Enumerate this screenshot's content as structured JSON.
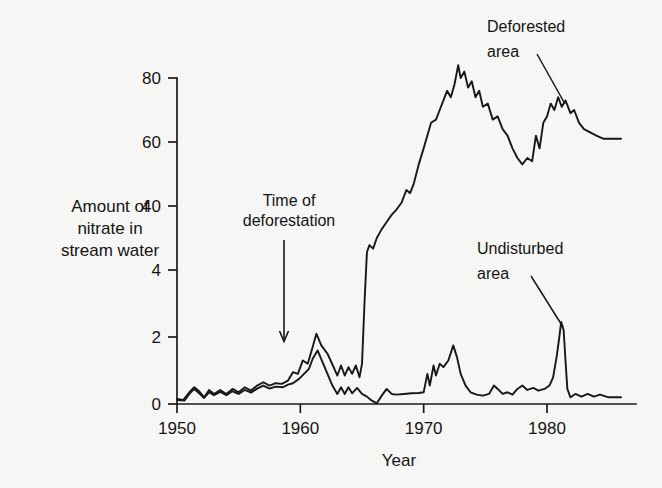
{
  "chart_data": {
    "type": "line",
    "title": "",
    "xlabel": "Year",
    "ylabel": "Amount of nitrate in stream water",
    "ylabel_lines": [
      "Amount of",
      "nitrate in",
      "stream water"
    ],
    "xlim": [
      1950,
      1986
    ],
    "xticks": [
      1950,
      1960,
      1970,
      1980
    ],
    "xtick_labels": [
      "1950",
      "1960",
      "1970",
      "1980"
    ],
    "yticks": [
      0,
      2,
      4,
      40,
      60,
      80
    ],
    "ytick_labels": [
      "0",
      "2",
      "4",
      "40",
      "60",
      "80"
    ],
    "y_axis_note": "broken / split scale: 0-4 expanded at bottom, 40-80 above",
    "grid": false,
    "legend": "annotations",
    "annotations": [
      {
        "text_lines": [
          "Time of",
          "deforestation"
        ],
        "text": "Time of deforestation",
        "points_to_year": 1958.5,
        "marker": "down-arrow"
      },
      {
        "text_lines": [
          "Deforested",
          "area"
        ],
        "text": "Deforested area",
        "points_to_year": 1977.5,
        "marker": "leader-line"
      },
      {
        "text_lines": [
          "Undisturbed",
          "area"
        ],
        "text": "Undisturbed area",
        "points_to_year": 1981.0,
        "marker": "leader-line"
      }
    ],
    "series": [
      {
        "name": "Deforested area",
        "points": [
          [
            1950.0,
            0.15
          ],
          [
            1950.5,
            0.12
          ],
          [
            1951.0,
            0.35
          ],
          [
            1951.4,
            0.5
          ],
          [
            1951.8,
            0.38
          ],
          [
            1952.2,
            0.2
          ],
          [
            1952.6,
            0.42
          ],
          [
            1953.0,
            0.3
          ],
          [
            1953.5,
            0.42
          ],
          [
            1954.0,
            0.3
          ],
          [
            1954.5,
            0.45
          ],
          [
            1955.0,
            0.35
          ],
          [
            1955.5,
            0.5
          ],
          [
            1956.0,
            0.4
          ],
          [
            1956.5,
            0.55
          ],
          [
            1957.0,
            0.65
          ],
          [
            1957.5,
            0.55
          ],
          [
            1958.0,
            0.62
          ],
          [
            1958.5,
            0.6
          ],
          [
            1959.0,
            0.7
          ],
          [
            1959.4,
            0.95
          ],
          [
            1959.8,
            0.9
          ],
          [
            1960.2,
            1.3
          ],
          [
            1960.6,
            1.2
          ],
          [
            1961.0,
            1.7
          ],
          [
            1961.3,
            2.1
          ],
          [
            1961.7,
            1.75
          ],
          [
            1962.2,
            1.5
          ],
          [
            1962.7,
            1.1
          ],
          [
            1963.0,
            0.85
          ],
          [
            1963.3,
            1.15
          ],
          [
            1963.6,
            0.85
          ],
          [
            1963.9,
            1.1
          ],
          [
            1964.2,
            0.9
          ],
          [
            1964.5,
            1.15
          ],
          [
            1964.8,
            0.8
          ],
          [
            1965.0,
            1.2
          ],
          [
            1965.2,
            3.0
          ],
          [
            1965.4,
            14
          ],
          [
            1965.6,
            18
          ],
          [
            1965.9,
            16
          ],
          [
            1966.2,
            22
          ],
          [
            1966.6,
            27
          ],
          [
            1967.0,
            31
          ],
          [
            1967.4,
            35
          ],
          [
            1967.8,
            38
          ],
          [
            1968.2,
            41
          ],
          [
            1968.6,
            45
          ],
          [
            1968.9,
            44
          ],
          [
            1969.2,
            47
          ],
          [
            1969.6,
            53
          ],
          [
            1970.0,
            58
          ],
          [
            1970.3,
            62
          ],
          [
            1970.6,
            66
          ],
          [
            1971.0,
            67
          ],
          [
            1971.3,
            70
          ],
          [
            1971.6,
            73
          ],
          [
            1971.9,
            76
          ],
          [
            1972.2,
            74
          ],
          [
            1972.5,
            78
          ],
          [
            1972.8,
            84
          ],
          [
            1973.0,
            80
          ],
          [
            1973.3,
            82
          ],
          [
            1973.6,
            77
          ],
          [
            1973.9,
            79
          ],
          [
            1974.2,
            74
          ],
          [
            1974.5,
            76
          ],
          [
            1974.8,
            71
          ],
          [
            1975.2,
            72
          ],
          [
            1975.6,
            67
          ],
          [
            1976.0,
            68
          ],
          [
            1976.4,
            64
          ],
          [
            1976.8,
            62
          ],
          [
            1977.2,
            58
          ],
          [
            1977.6,
            55
          ],
          [
            1978.0,
            53
          ],
          [
            1978.4,
            55
          ],
          [
            1978.8,
            54
          ],
          [
            1979.1,
            62
          ],
          [
            1979.4,
            58
          ],
          [
            1979.7,
            66
          ],
          [
            1980.0,
            68
          ],
          [
            1980.3,
            72
          ],
          [
            1980.6,
            70
          ],
          [
            1980.9,
            74
          ],
          [
            1981.2,
            71
          ],
          [
            1981.5,
            73
          ],
          [
            1981.9,
            69
          ],
          [
            1982.2,
            70
          ],
          [
            1982.6,
            66
          ],
          [
            1983.0,
            64
          ],
          [
            1983.5,
            63
          ],
          [
            1984.0,
            62
          ],
          [
            1984.6,
            61
          ],
          [
            1985.3,
            61
          ],
          [
            1986.0,
            61
          ]
        ]
      },
      {
        "name": "Undisturbed area",
        "points": [
          [
            1950.0,
            0.12
          ],
          [
            1950.6,
            0.1
          ],
          [
            1951.0,
            0.3
          ],
          [
            1951.4,
            0.45
          ],
          [
            1951.8,
            0.32
          ],
          [
            1952.2,
            0.18
          ],
          [
            1952.6,
            0.35
          ],
          [
            1953.0,
            0.26
          ],
          [
            1953.5,
            0.36
          ],
          [
            1954.0,
            0.26
          ],
          [
            1954.5,
            0.38
          ],
          [
            1955.0,
            0.3
          ],
          [
            1955.5,
            0.42
          ],
          [
            1956.0,
            0.34
          ],
          [
            1956.5,
            0.46
          ],
          [
            1957.0,
            0.55
          ],
          [
            1957.5,
            0.46
          ],
          [
            1958.0,
            0.52
          ],
          [
            1958.6,
            0.5
          ],
          [
            1959.0,
            0.58
          ],
          [
            1959.4,
            0.62
          ],
          [
            1959.9,
            0.75
          ],
          [
            1960.3,
            0.9
          ],
          [
            1960.7,
            1.05
          ],
          [
            1961.0,
            1.35
          ],
          [
            1961.4,
            1.6
          ],
          [
            1961.8,
            1.25
          ],
          [
            1962.2,
            0.9
          ],
          [
            1962.6,
            0.55
          ],
          [
            1963.0,
            0.3
          ],
          [
            1963.3,
            0.5
          ],
          [
            1963.6,
            0.3
          ],
          [
            1963.9,
            0.5
          ],
          [
            1964.2,
            0.32
          ],
          [
            1964.6,
            0.48
          ],
          [
            1965.0,
            0.3
          ],
          [
            1965.4,
            0.22
          ],
          [
            1965.8,
            0.1
          ],
          [
            1966.2,
            0.02
          ],
          [
            1966.6,
            0.25
          ],
          [
            1967.0,
            0.45
          ],
          [
            1967.4,
            0.3
          ],
          [
            1967.8,
            0.28
          ],
          [
            1968.4,
            0.3
          ],
          [
            1969.0,
            0.32
          ],
          [
            1969.6,
            0.33
          ],
          [
            1970.0,
            0.35
          ],
          [
            1970.3,
            0.9
          ],
          [
            1970.5,
            0.55
          ],
          [
            1970.8,
            1.15
          ],
          [
            1971.0,
            0.85
          ],
          [
            1971.3,
            1.2
          ],
          [
            1971.6,
            1.1
          ],
          [
            1972.0,
            1.3
          ],
          [
            1972.4,
            1.75
          ],
          [
            1972.7,
            1.4
          ],
          [
            1973.0,
            0.9
          ],
          [
            1973.4,
            0.55
          ],
          [
            1973.8,
            0.35
          ],
          [
            1974.3,
            0.28
          ],
          [
            1974.8,
            0.25
          ],
          [
            1975.3,
            0.3
          ],
          [
            1975.7,
            0.55
          ],
          [
            1976.0,
            0.45
          ],
          [
            1976.4,
            0.3
          ],
          [
            1976.8,
            0.35
          ],
          [
            1977.2,
            0.28
          ],
          [
            1977.6,
            0.45
          ],
          [
            1978.0,
            0.55
          ],
          [
            1978.4,
            0.42
          ],
          [
            1978.9,
            0.48
          ],
          [
            1979.3,
            0.4
          ],
          [
            1979.8,
            0.45
          ],
          [
            1980.2,
            0.55
          ],
          [
            1980.5,
            0.8
          ],
          [
            1980.8,
            1.45
          ],
          [
            1981.0,
            2.0
          ],
          [
            1981.15,
            2.45
          ],
          [
            1981.35,
            2.2
          ],
          [
            1981.5,
            1.3
          ],
          [
            1981.65,
            0.45
          ],
          [
            1981.9,
            0.2
          ],
          [
            1982.3,
            0.3
          ],
          [
            1982.8,
            0.22
          ],
          [
            1983.3,
            0.3
          ],
          [
            1983.8,
            0.22
          ],
          [
            1984.3,
            0.28
          ],
          [
            1985.0,
            0.2
          ],
          [
            1986.0,
            0.2
          ]
        ]
      }
    ]
  },
  "figure": {
    "axis_tick_font_px": 17,
    "accent_color": "#171717",
    "background_color": "#f7f7f5"
  }
}
